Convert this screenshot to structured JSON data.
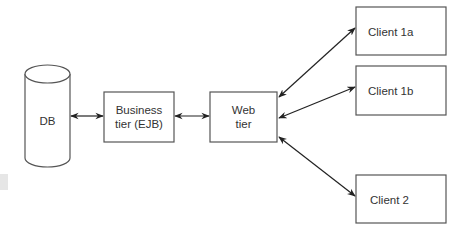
{
  "diagram": {
    "type": "architecture",
    "nodes": [
      {
        "id": "db",
        "shape": "cylinder",
        "label": "DB"
      },
      {
        "id": "business",
        "shape": "rect",
        "label_lines": [
          "Business",
          "tier (EJB)"
        ]
      },
      {
        "id": "web",
        "shape": "rect",
        "label_lines": [
          "Web",
          "tier"
        ]
      },
      {
        "id": "client1a",
        "shape": "rect",
        "label": "Client 1a"
      },
      {
        "id": "client1b",
        "shape": "rect",
        "label": "Client 1b"
      },
      {
        "id": "client2",
        "shape": "rect",
        "label": "Client 2"
      }
    ],
    "edges": [
      {
        "from": "db",
        "to": "business",
        "direction": "bidirectional"
      },
      {
        "from": "business",
        "to": "web",
        "direction": "bidirectional"
      },
      {
        "from": "web",
        "to": "client1a",
        "direction": "bidirectional"
      },
      {
        "from": "web",
        "to": "client1b",
        "direction": "bidirectional"
      },
      {
        "from": "web",
        "to": "client2",
        "direction": "bidirectional"
      }
    ]
  },
  "labels": {
    "db": "DB",
    "business_line1": "Business",
    "business_line2": "tier (EJB)",
    "web_line1": "Web",
    "web_line2": "tier",
    "client1a": "Client 1a",
    "client1b": "Client 1b",
    "client2": "Client 2"
  },
  "colors": {
    "stroke": "#555555",
    "arrow": "#222222",
    "text": "#333333",
    "background": "#ffffff"
  }
}
